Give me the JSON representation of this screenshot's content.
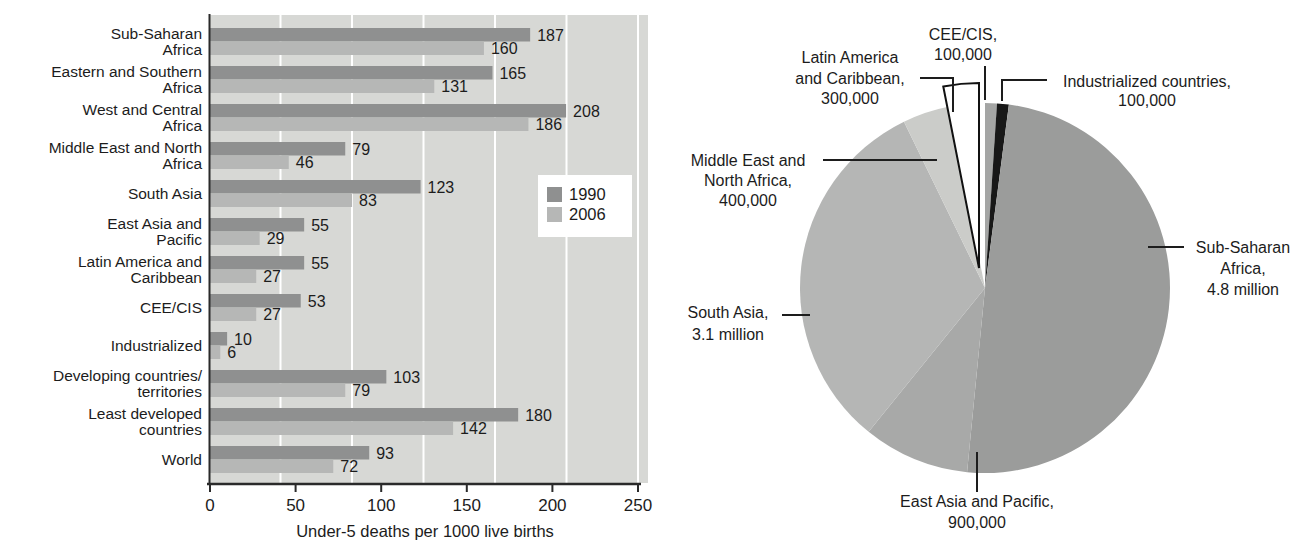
{
  "figure": {
    "background": "#ffffff",
    "text_color": "#1c1c1c"
  },
  "chart_data": [
    {
      "type": "bar",
      "orientation": "horizontal",
      "title": "",
      "xlabel": "Under-5 deaths per 1000 live births",
      "xlim": [
        0,
        250
      ],
      "xticks": [
        0,
        50,
        100,
        150,
        200,
        250
      ],
      "grid": "on",
      "plot_bg": "#d7d8d5",
      "gridline_color": "#ffffff",
      "legend": {
        "position": "middle-right",
        "background": "#ffffff"
      },
      "series": [
        {
          "name": "1990",
          "color": "#8f9090",
          "values": [
            187,
            165,
            208,
            79,
            123,
            55,
            55,
            53,
            10,
            103,
            180,
            93
          ]
        },
        {
          "name": "2006",
          "color": "#b6b7b6",
          "values": [
            160,
            131,
            186,
            46,
            83,
            29,
            27,
            27,
            6,
            79,
            142,
            72
          ]
        }
      ],
      "categories": [
        {
          "id": "sub-saharan-africa",
          "label": "Sub-Saharan Africa",
          "label_lines": [
            "Sub-Saharan",
            "Africa"
          ]
        },
        {
          "id": "eastern-southern-africa",
          "label": "Eastern and Southern Africa",
          "label_lines": [
            "Eastern and Southern",
            "Africa"
          ]
        },
        {
          "id": "west-central-africa",
          "label": "West and Central Africa",
          "label_lines": [
            "West and Central",
            "Africa"
          ]
        },
        {
          "id": "middle-east-north-africa",
          "label": "Middle East and North Africa",
          "label_lines": [
            "Middle East and North",
            "Africa"
          ]
        },
        {
          "id": "south-asia",
          "label": "South Asia",
          "label_lines": [
            "South Asia"
          ]
        },
        {
          "id": "east-asia-pacific",
          "label": "East Asia and Pacific",
          "label_lines": [
            "East Asia and",
            "Pacific"
          ]
        },
        {
          "id": "latin-america-caribbean",
          "label": "Latin America and Caribbean",
          "label_lines": [
            "Latin America and",
            "Caribbean"
          ]
        },
        {
          "id": "cee-cis",
          "label": "CEE/CIS",
          "label_lines": [
            "CEE/CIS"
          ]
        },
        {
          "id": "industrialized",
          "label": "Industrialized",
          "label_lines": [
            "Industrialized"
          ]
        },
        {
          "id": "developing-countries-territories",
          "label": "Developing countries/territories",
          "label_lines": [
            "Developing countries/",
            "territories"
          ]
        },
        {
          "id": "least-developed-countries",
          "label": "Least developed countries",
          "label_lines": [
            "Least developed",
            "countries"
          ]
        },
        {
          "id": "world",
          "label": "World",
          "label_lines": [
            "World"
          ]
        }
      ]
    },
    {
      "type": "pie",
      "direction": "clockwise",
      "start_angle_from_top_deg": 0,
      "slices": [
        {
          "id": "cee-cis",
          "label": "CEE/CIS",
          "value": 100000,
          "value_label": "100,000",
          "label_lines": [
            "CEE/CIS,",
            "100,000"
          ],
          "color": "#a4a5a4"
        },
        {
          "id": "industrialized-countries",
          "label": "Industrialized countries",
          "value": 100000,
          "value_label": "100,000",
          "label_lines": [
            "Industrialized countries,",
            "100,000"
          ],
          "color": "#181818"
        },
        {
          "id": "sub-saharan-africa",
          "label": "Sub-Saharan Africa",
          "value": 4800000,
          "value_label": "4.8 million",
          "label_lines": [
            "Sub-Saharan",
            "Africa,",
            "4.8 million"
          ],
          "color": "#9b9c9b"
        },
        {
          "id": "east-asia-pacific",
          "label": "East Asia and Pacific",
          "value": 900000,
          "value_label": "900,000",
          "label_lines": [
            "East Asia and Pacific,",
            "900,000"
          ],
          "color": "#a8a9a8"
        },
        {
          "id": "south-asia",
          "label": "South Asia",
          "value": 3100000,
          "value_label": "3.1 million",
          "label_lines": [
            "South Asia,",
            "3.1 million"
          ],
          "color": "#b5b6b5"
        },
        {
          "id": "middle-east-north-africa",
          "label": "Middle East and North Africa",
          "value": 400000,
          "value_label": "400,000",
          "label_lines": [
            "Middle East and",
            "North Africa,",
            "400,000"
          ],
          "color": "#cbccc9"
        },
        {
          "id": "latin-america-caribbean",
          "label": "Latin America and Caribbean",
          "value": 300000,
          "value_label": "300,000",
          "label_lines": [
            "Latin America",
            "and Caribbean,",
            "300,000"
          ],
          "color": "#ffffff",
          "exploded": true,
          "outlined": true,
          "outline_color": "#111111"
        }
      ]
    }
  ]
}
